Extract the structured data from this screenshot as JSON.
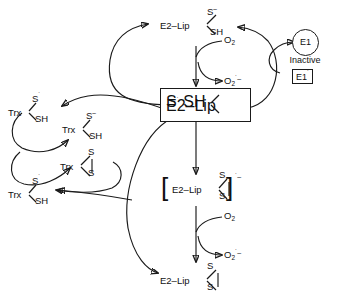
{
  "diagram": {
    "type": "reaction-scheme",
    "stroke_color": "#1a1a1a",
    "background_color": "#ffffff"
  },
  "species": {
    "e2lip_thiolate": {
      "id": "e2lip-thiolate",
      "base": "E2–Lip",
      "arm_top": "S",
      "arm_top_charge": "–",
      "arm_bottom": "SH",
      "boxed": false
    },
    "e2lip_radical": {
      "id": "e2lip-radical",
      "base": "E2–Lip",
      "arm_top": "S",
      "arm_top_charge": "˙",
      "arm_bottom": "SH",
      "boxed": true
    },
    "e2lip_disulfide_radical_anion": {
      "id": "e2lip-disulfide-radical-anion",
      "base": "E2–Lip",
      "arm_top": "S",
      "arm_bottom": "S",
      "bracket_left": "[",
      "bracket_right": "]",
      "bracket_charge": "˙–",
      "boxed": false
    },
    "e2lip_disulfide": {
      "id": "e2lip-disulfide",
      "base": "E2–Lip",
      "arm_top": "S",
      "arm_bottom": "S",
      "boxed": false
    },
    "trx_radical_upper": {
      "id": "trx-radical-upper",
      "base": "Trx",
      "arm_top": "S",
      "arm_top_charge": "˙",
      "arm_bottom": "SH"
    },
    "trx_thiolate": {
      "id": "trx-thiolate",
      "base": "Trx",
      "arm_top": "S",
      "arm_top_charge": "–",
      "arm_bottom": "SH"
    },
    "trx_disulfide": {
      "id": "trx-disulfide",
      "base": "Trx",
      "arm_top": "S",
      "arm_bottom": "S"
    },
    "trx_radical_lower": {
      "id": "trx-radical-lower",
      "base": "Trx",
      "arm_top": "S",
      "arm_top_charge": "˙",
      "arm_bottom": "SH"
    }
  },
  "enzymes": {
    "e1_inactive": {
      "circle_label": "E1",
      "caption": "Inactive"
    },
    "e1_activated": {
      "box_label": "E1",
      "box_label_mark": "˙"
    }
  },
  "oxygen": {
    "top": {
      "reactant": "O",
      "reactant_sub": "2",
      "product": "O",
      "product_sub": "2",
      "product_sup": "˙–"
    },
    "bottom": {
      "reactant": "O",
      "reactant_sub": "2",
      "product": "O",
      "product_sub": "2",
      "product_sup": "˙–"
    }
  }
}
